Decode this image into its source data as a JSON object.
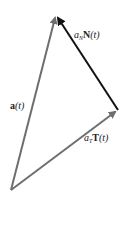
{
  "diagram": {
    "type": "vector-decomposition",
    "vectors": [
      {
        "id": "a",
        "label_bold": "a",
        "label_arg": "(t)",
        "from": [
          11,
          190
        ],
        "to": [
          56,
          15
        ],
        "color": "#6e6e6e"
      },
      {
        "id": "aT",
        "label_coef": "a",
        "label_sub": "T",
        "label_bold": "T",
        "label_arg": "(t)",
        "from": [
          11,
          190
        ],
        "to": [
          118,
          110
        ],
        "color": "#6e6e6e"
      },
      {
        "id": "aN",
        "label_coef": "a",
        "label_sub": "N",
        "label_bold": "N",
        "label_arg": "(t)",
        "from": [
          118,
          110
        ],
        "to": [
          56,
          15
        ],
        "color": "#111111"
      }
    ]
  },
  "labels": {
    "a": {
      "bold": "a",
      "arg": "(t)"
    },
    "aT": {
      "coef": "a",
      "sub": "T",
      "bold": "T",
      "arg": "(t)"
    },
    "aN": {
      "coef": "a",
      "sub": "N",
      "bold": "N",
      "arg": "(t)"
    }
  }
}
